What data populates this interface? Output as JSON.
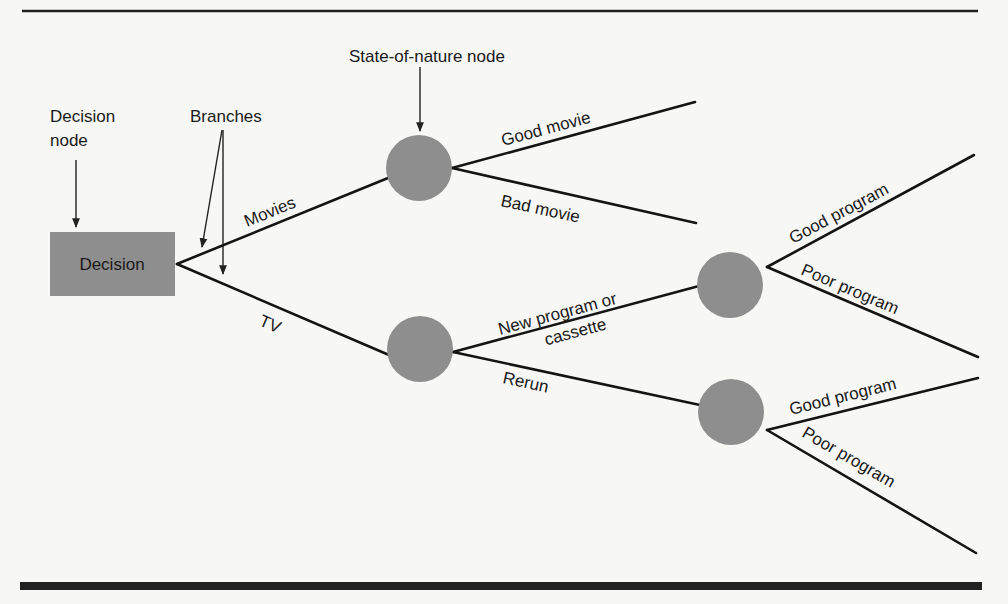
{
  "diagram": {
    "type": "decision-tree",
    "colors": {
      "node_fill": "#8e8e8e",
      "line": "#141414",
      "background": "#f7f7f5"
    },
    "annotations": {
      "decision_node": [
        "Decision",
        "node"
      ],
      "branches": "Branches",
      "state_of_nature_node": "State-of-nature node"
    },
    "root": {
      "label": "Decision",
      "shape": "rectangle"
    },
    "branches": {
      "movies": "Movies",
      "tv": "TV",
      "good_movie": "Good movie",
      "bad_movie": "Bad movie",
      "new_program": [
        "New program or",
        "cassette"
      ],
      "rerun": "Rerun",
      "upper_good_program": "Good program",
      "upper_poor_program": "Poor program",
      "lower_good_program": "Good program",
      "lower_poor_program": "Poor program"
    }
  }
}
